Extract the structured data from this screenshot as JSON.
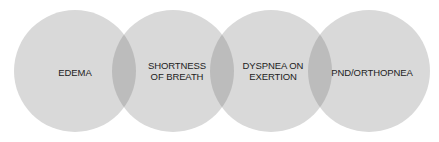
{
  "diagram": {
    "type": "overlapping-circles-chain",
    "colors": {
      "circle_fill": "#d9d9d9",
      "overlap_fill": "#bcbcbc",
      "text": "#222222"
    },
    "circles": [
      {
        "label": "EDEMA",
        "cx": 75,
        "cy": 71,
        "r": 61
      },
      {
        "label": "SHORTNESS OF BREATH",
        "cx": 173,
        "cy": 71,
        "r": 61
      },
      {
        "label": "DYSPNEA ON EXERTION",
        "cx": 271,
        "cy": 71,
        "r": 61
      },
      {
        "label": "PND/ORTHOPNEA",
        "cx": 369,
        "cy": 71,
        "r": 61
      }
    ]
  }
}
